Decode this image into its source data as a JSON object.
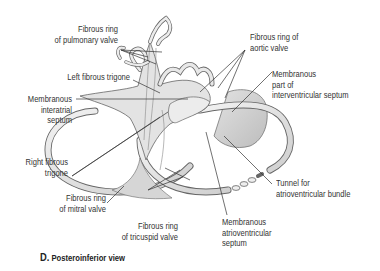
{
  "figure": {
    "caption_letter": "D.",
    "caption_text": "Posteroinferior view"
  },
  "labels": {
    "pulmonary_ring": [
      "Fibrous ring",
      "of pulmonary valve"
    ],
    "left_trigone": [
      "Left fibrous trigone"
    ],
    "interatrial": [
      "Membranous",
      "interatrial",
      "septum"
    ],
    "right_trigone": [
      "Right fibrous",
      "trigone"
    ],
    "mitral_ring": [
      "Fibrous ring",
      "of mitral valve"
    ],
    "tricuspid_ring": [
      "Fibrous ring",
      "of tricuspid valve"
    ],
    "aortic_ring": [
      "Fibrous ring of",
      "aortic valve"
    ],
    "interventricular": [
      "Membranous",
      "part of",
      "interventricular septum"
    ],
    "tunnel": [
      "Tunnel for",
      "atrioventricular bundle"
    ],
    "av_septum": [
      "Membranous",
      "atrioventricular",
      "septum"
    ]
  },
  "colors": {
    "structure_fill": "#e4e4e4",
    "structure_shade": "#c8c8c8",
    "outline": "#555555",
    "leader": "#333333",
    "membrane": "#cfcfcf"
  }
}
